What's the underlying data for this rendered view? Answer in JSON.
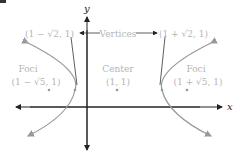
{
  "diagram": {
    "type": "hyperbola",
    "axes": {
      "x_label": "x",
      "y_label": "y"
    },
    "labels": {
      "left_vertex": "(1 − √2, 1)",
      "vertices": "Vertices",
      "right_vertex": "(1 + √2, 1)",
      "left_foci_title": "Foci",
      "left_foci_coord": "(1 − √5, 1)",
      "center_title": "Center",
      "center_coord": "(1, 1)",
      "right_foci_title": "Foci",
      "right_foci_coord": "(1 + √5, 1)"
    },
    "points": [
      {
        "name": "left-focus",
        "x": 49,
        "y": 90
      },
      {
        "name": "left-vertex",
        "x": 75,
        "y": 90
      },
      {
        "name": "center",
        "x": 117,
        "y": 90
      },
      {
        "name": "right-vertex",
        "x": 162,
        "y": 90
      },
      {
        "name": "right-focus",
        "x": 187,
        "y": 90
      }
    ],
    "colors": {
      "axis": "#222222",
      "curve": "#999999",
      "text": "#b5b5b5",
      "points": "#999999"
    }
  }
}
